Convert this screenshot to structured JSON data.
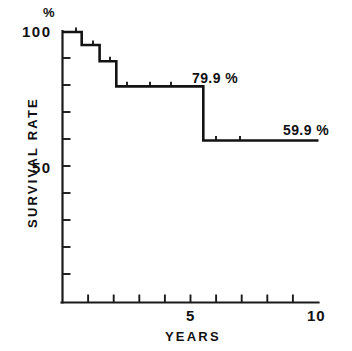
{
  "chart_data": {
    "type": "line",
    "subtype": "kaplan-meier-step",
    "title": "",
    "xlabel": "YEARS",
    "ylabel": "SURVIVAL RATE",
    "yunit": "%",
    "xlim": [
      0,
      10
    ],
    "ylim": [
      0,
      100
    ],
    "grid": false,
    "legend": null,
    "x_ticks": [
      0,
      1,
      2,
      3,
      4,
      5,
      6,
      7,
      8,
      9,
      10
    ],
    "x_tick_labels": [
      "",
      "",
      "",
      "",
      "",
      "5",
      "",
      "",
      "",
      "",
      "10"
    ],
    "y_ticks": [
      0,
      10,
      20,
      30,
      40,
      50,
      60,
      70,
      80,
      90,
      100
    ],
    "y_tick_labels": [
      "",
      "",
      "",
      "",
      "",
      "50",
      "",
      "",
      "",
      "",
      "100"
    ],
    "x": [
      0,
      0.75,
      1.45,
      2.1,
      5.5,
      10
    ],
    "values": [
      100,
      95.2,
      89.2,
      79.9,
      59.9,
      59.9
    ],
    "steps": [
      {
        "x_start": 0,
        "x_end": 0.75,
        "y": 100
      },
      {
        "x_start": 0.75,
        "x_end": 1.45,
        "y": 95.2
      },
      {
        "x_start": 1.45,
        "x_end": 2.1,
        "y": 89.2
      },
      {
        "x_start": 2.1,
        "x_end": 5.5,
        "y": 79.9
      },
      {
        "x_start": 5.5,
        "x_end": 10,
        "y": 59.9
      }
    ],
    "annotations": [
      {
        "text": "79.9 %",
        "x": 5.0,
        "y": 79.9
      },
      {
        "text": "59.9 %",
        "x": 9.6,
        "y": 59.9
      }
    ],
    "line_color": "#131313",
    "axis_color": "#1a1a1a",
    "background_color": "#ffffff"
  },
  "axes": {
    "y_label_top": "100",
    "y_label_mid": "50",
    "y_unit_symbol": "%",
    "y_title": "SURVIVAL RATE",
    "x_label_mid": "5",
    "x_label_end": "10",
    "x_title": "YEARS"
  },
  "annotations": {
    "upper_plateau": "79.9 %",
    "lower_plateau": "59.9 %"
  }
}
